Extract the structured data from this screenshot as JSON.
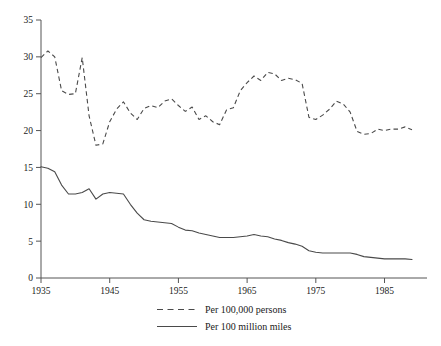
{
  "chart_data": {
    "type": "line",
    "title": "",
    "subtitle": "",
    "xlabel": "",
    "ylabel": "",
    "xlim": [
      1935,
      1989
    ],
    "ylim": [
      0,
      35
    ],
    "grid": false,
    "legend_position": "bottom-center",
    "x_ticks": [
      "1935",
      "1945",
      "1955",
      "1965",
      "1975",
      "1985"
    ],
    "x_tick_values": [
      1935,
      1945,
      1955,
      1965,
      1975,
      1985
    ],
    "y_ticks": [
      "0",
      "5",
      "10",
      "15",
      "20",
      "25",
      "30",
      "35"
    ],
    "y_tick_values": [
      0,
      5,
      10,
      15,
      20,
      25,
      30,
      35
    ],
    "x": [
      1935,
      1936,
      1937,
      1938,
      1939,
      1940,
      1941,
      1942,
      1943,
      1944,
      1945,
      1946,
      1947,
      1948,
      1949,
      1950,
      1951,
      1952,
      1953,
      1954,
      1955,
      1956,
      1957,
      1958,
      1959,
      1960,
      1961,
      1962,
      1963,
      1964,
      1965,
      1966,
      1967,
      1968,
      1969,
      1970,
      1971,
      1972,
      1973,
      1974,
      1975,
      1976,
      1977,
      1978,
      1979,
      1980,
      1981,
      1982,
      1983,
      1984,
      1985,
      1986,
      1987,
      1988,
      1989
    ],
    "series": [
      {
        "name": "Per 100,000 persons",
        "style": "dashed",
        "color": "#4a4a4a",
        "values": [
          29.9,
          30.8,
          30.0,
          25.4,
          24.9,
          25.0,
          29.9,
          22.0,
          18.0,
          18.2,
          21.2,
          22.9,
          23.9,
          22.4,
          21.5,
          23.0,
          23.4,
          23.1,
          24.0,
          24.3,
          23.4,
          22.6,
          23.2,
          21.5,
          22.0,
          21.2,
          20.8,
          22.8,
          23.1,
          25.4,
          26.5,
          27.4,
          26.8,
          27.9,
          27.7,
          26.8,
          27.1,
          26.9,
          26.4,
          21.8,
          21.5,
          22.1,
          22.9,
          24.0,
          23.6,
          22.5,
          19.9,
          19.5,
          19.6,
          20.2,
          20.0,
          20.2,
          20.2,
          20.5,
          20.1
        ]
      },
      {
        "name": "Per 100 million miles",
        "style": "solid",
        "color": "#4a4a4a",
        "values": [
          15.1,
          14.9,
          14.4,
          12.6,
          11.4,
          11.4,
          11.6,
          12.1,
          10.7,
          11.4,
          11.6,
          11.5,
          11.4,
          10.0,
          8.8,
          7.9,
          7.7,
          7.6,
          7.5,
          7.4,
          6.9,
          6.5,
          6.4,
          6.1,
          5.9,
          5.7,
          5.5,
          5.5,
          5.5,
          5.6,
          5.7,
          5.9,
          5.7,
          5.6,
          5.3,
          5.1,
          4.8,
          4.6,
          4.3,
          3.7,
          3.5,
          3.4,
          3.4,
          3.4,
          3.4,
          3.4,
          3.2,
          2.9,
          2.8,
          2.7,
          2.6,
          2.6,
          2.6,
          2.6,
          2.5
        ]
      }
    ],
    "legend": [
      {
        "label": "Per 100,000 persons",
        "style": "dashed"
      },
      {
        "label": "Per 100 million miles",
        "style": "solid"
      }
    ]
  }
}
